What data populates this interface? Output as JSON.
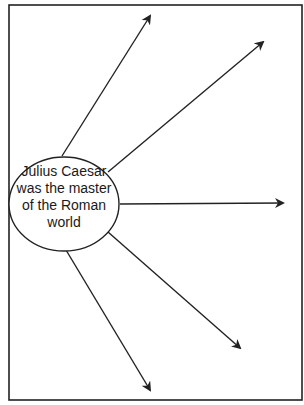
{
  "diagram": {
    "type": "spider-map",
    "frame": {
      "x": 9,
      "y": 5,
      "width": 293,
      "height": 395,
      "stroke": "#222222"
    },
    "center": {
      "cx": 64,
      "cy": 204,
      "rx": 55,
      "ry": 47,
      "lines": [
        "Julius Caesar",
        "was the master",
        "of the Roman",
        "world"
      ]
    },
    "arrows": [
      {
        "id": "arrow-1",
        "x1": 62,
        "y1": 156,
        "x2": 150,
        "y2": 16,
        "label": ""
      },
      {
        "id": "arrow-2",
        "x1": 108,
        "y1": 172,
        "x2": 263,
        "y2": 42,
        "label": ""
      },
      {
        "id": "arrow-3",
        "x1": 120,
        "y1": 204,
        "x2": 283,
        "y2": 203,
        "label": ""
      },
      {
        "id": "arrow-4",
        "x1": 108,
        "y1": 232,
        "x2": 240,
        "y2": 348,
        "label": ""
      },
      {
        "id": "arrow-5",
        "x1": 66,
        "y1": 250,
        "x2": 150,
        "y2": 390,
        "label": ""
      }
    ],
    "colors": {
      "stroke": "#222222",
      "background": "#ffffff",
      "text": "#1a1a1a"
    }
  }
}
